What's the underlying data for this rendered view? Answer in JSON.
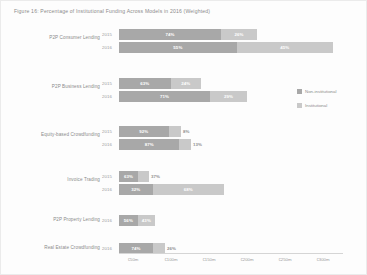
{
  "figure": {
    "title": "Figure 16: Percentage of Institutional Funding Across Models in 2016 (Weighted)"
  },
  "legend": {
    "items": [
      {
        "label": "Non-institutional",
        "color": "#a8a8a8",
        "key": "non_institutional"
      },
      {
        "label": "Institutional",
        "color": "#c9c9c9",
        "key": "institutional"
      }
    ]
  },
  "axis": {
    "ticks": [
      "€50m",
      "€100m",
      "€150m",
      "€200m",
      "€250m",
      "€300m"
    ]
  },
  "chart_data": {
    "type": "bar",
    "title": "Figure 16: Percentage of Institutional Funding Across Models in 2016 (Weighted)",
    "orientation": "horizontal",
    "stacked": true,
    "xlabel": "",
    "ylabel": "",
    "xlim": [
      0,
      300
    ],
    "x_unit": "EUR millions",
    "grid": false,
    "legend_position": "right",
    "series": [
      {
        "name": "Non-institutional",
        "color": "#a8a8a8"
      },
      {
        "name": "Institutional",
        "color": "#c9c9c9"
      }
    ],
    "categories": [
      "P2P Consumer Lending",
      "P2P Business Lending",
      "Equity-based Crowdfunding",
      "Invoice Trading",
      "P2P Property Lending",
      "Real Estate Crowdfunding"
    ],
    "rows": [
      {
        "category": "P2P Consumer Lending",
        "year": "2015",
        "non_institutional_pct": "74%",
        "institutional_pct": "26%",
        "non_institutional_value": 74,
        "institutional_value": 26,
        "total_value": 163
      },
      {
        "category": "P2P Consumer Lending",
        "year": "2016",
        "non_institutional_pct": "55%",
        "institutional_pct": "45%",
        "non_institutional_value": 55,
        "institutional_value": 45,
        "total_value": 250
      },
      {
        "category": "P2P Business Lending",
        "year": "2015",
        "non_institutional_pct": "63%",
        "institutional_pct": "24%",
        "non_institutional_value": 63,
        "institutional_value": 24,
        "total_value": 88
      },
      {
        "category": "P2P Business Lending",
        "year": "2016",
        "non_institutional_pct": "71%",
        "institutional_pct": "29%",
        "non_institutional_value": 71,
        "institutional_value": 29,
        "total_value": 150
      },
      {
        "category": "Equity-based Crowdfunding",
        "year": "2015",
        "non_institutional_pct": "92%",
        "institutional_pct": "8%",
        "non_institutional_value": 92,
        "institutional_value": 8,
        "total_value": 70
      },
      {
        "category": "Equity-based Crowdfunding",
        "year": "2016",
        "non_institutional_pct": "87%",
        "institutional_pct": "13%",
        "non_institutional_value": 87,
        "institutional_value": 13,
        "total_value": 82
      },
      {
        "category": "Invoice Trading",
        "year": "2015",
        "non_institutional_pct": "63%",
        "institutional_pct": "37%",
        "non_institutional_value": 63,
        "institutional_value": 37,
        "total_value": 48
      },
      {
        "category": "Invoice Trading",
        "year": "2016",
        "non_institutional_pct": "32%",
        "institutional_pct": "68%",
        "non_institutional_value": 32,
        "institutional_value": 68,
        "total_value": 122
      },
      {
        "category": "P2P Property Lending",
        "year": "2016",
        "non_institutional_pct": "56%",
        "institutional_pct": "43%",
        "non_institutional_value": 56,
        "institutional_value": 43,
        "total_value": 40
      },
      {
        "category": "Real Estate Crowdfunding",
        "year": "2016",
        "non_institutional_pct": "74%",
        "institutional_pct": "26%",
        "non_institutional_value": 74,
        "institutional_value": 26,
        "total_value": 38
      }
    ]
  },
  "layout": {
    "groups": [
      {
        "label_top": 10,
        "rows": [
          {
            "top": 4,
            "width": 138,
            "split": 0.74,
            "inside_inst": true
          },
          {
            "top": 17,
            "width": 214,
            "split": 0.55,
            "inside_inst": true
          }
        ]
      },
      {
        "label_top": 59,
        "rows": [
          {
            "top": 53,
            "width": 82,
            "split": 0.63,
            "inside_inst": true
          },
          {
            "top": 66,
            "width": 128,
            "split": 0.71,
            "inside_inst": true
          }
        ]
      },
      {
        "label_top": 107,
        "rows": [
          {
            "top": 101,
            "width": 62,
            "split": 0.8,
            "inside_inst": false
          },
          {
            "top": 114,
            "width": 72,
            "split": 0.84,
            "inside_inst": false
          }
        ]
      },
      {
        "label_top": 152,
        "rows": [
          {
            "top": 146,
            "width": 30,
            "split": 0.63,
            "inside_inst": false
          },
          {
            "top": 159,
            "width": 105,
            "split": 0.32,
            "inside_inst": true
          }
        ]
      },
      {
        "label_top": 192,
        "rows": [
          {
            "top": 190,
            "width": 36,
            "split": 0.52,
            "inside_inst": true
          }
        ]
      },
      {
        "label_top": 220,
        "rows": [
          {
            "top": 218,
            "width": 46,
            "split": 0.74,
            "inside_inst": false
          }
        ]
      }
    ],
    "tick_x": [
      132,
      170,
      208,
      246,
      284,
      322
    ]
  }
}
